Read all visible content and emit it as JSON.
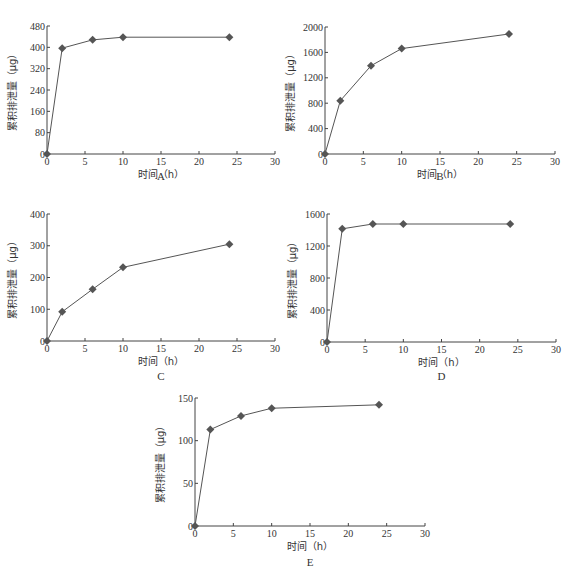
{
  "chart_data": [
    {
      "id": "A",
      "type": "line",
      "panel_label": "A",
      "xlabel": "时间（h）",
      "ylabel": "累积排泄量（μg）",
      "x": [
        0,
        2,
        6,
        10,
        24
      ],
      "values": [
        0,
        397,
        428,
        438,
        438
      ],
      "xlim": [
        0,
        30
      ],
      "ylim": [
        0,
        480
      ],
      "xticks": [
        0,
        5,
        10,
        15,
        20,
        25,
        30
      ],
      "yticks": [
        0,
        80,
        160,
        240,
        320,
        400,
        480
      ],
      "grid": false,
      "marker": "diamond",
      "layout": {
        "x0": 47,
        "x1": 275,
        "yTop": 26,
        "yBottom": 154,
        "labelY": 180
      }
    },
    {
      "id": "B",
      "type": "line",
      "panel_label": "B",
      "xlabel": "时间（h）",
      "ylabel": "累积排泄量（μg）",
      "x": [
        0,
        2,
        6,
        10,
        24
      ],
      "values": [
        0,
        840,
        1390,
        1660,
        1890
      ],
      "xlim": [
        0,
        30
      ],
      "ylim": [
        0,
        2000
      ],
      "xticks": [
        0,
        5,
        10,
        15,
        20,
        25,
        30
      ],
      "yticks": [
        0,
        400,
        800,
        1200,
        1600,
        2000
      ],
      "grid": false,
      "marker": "diamond",
      "layout": {
        "x0": 325,
        "x1": 555,
        "yTop": 27,
        "yBottom": 154,
        "labelY": 180
      }
    },
    {
      "id": "C",
      "type": "line",
      "panel_label": "C",
      "xlabel": "时间（h）",
      "ylabel": "累积排泄量（μg）",
      "x": [
        0,
        2,
        6,
        10,
        24
      ],
      "values": [
        0,
        92,
        163,
        232,
        305
      ],
      "xlim": [
        0,
        30
      ],
      "ylim": [
        0,
        400
      ],
      "xticks": [
        0,
        5,
        10,
        15,
        20,
        25,
        30
      ],
      "yticks": [
        0,
        100,
        200,
        300,
        400
      ],
      "grid": false,
      "marker": "diamond",
      "layout": {
        "x0": 47,
        "x1": 275,
        "yTop": 214,
        "yBottom": 341,
        "labelY": 380
      }
    },
    {
      "id": "D",
      "type": "line",
      "panel_label": "D",
      "xlabel": "时间（h）",
      "ylabel": "累积排泄量（μg）",
      "x": [
        0,
        2,
        6,
        10,
        24
      ],
      "values": [
        0,
        1415,
        1475,
        1475,
        1475
      ],
      "xlim": [
        0,
        30
      ],
      "ylim": [
        0,
        1600
      ],
      "xticks": [
        0,
        5,
        10,
        15,
        20,
        25,
        30
      ],
      "yticks": [
        0,
        400,
        800,
        1200,
        1600
      ],
      "grid": false,
      "marker": "diamond",
      "layout": {
        "x0": 327,
        "x1": 556,
        "yTop": 214,
        "yBottom": 342,
        "labelY": 380
      }
    },
    {
      "id": "E",
      "type": "line",
      "panel_label": "E",
      "xlabel": "时间（h）",
      "ylabel": "累积排泄量（μg）",
      "x": [
        0,
        2,
        6,
        10,
        24
      ],
      "values": [
        0,
        113,
        129,
        138,
        142
      ],
      "xlim": [
        0,
        30
      ],
      "ylim": [
        0,
        150
      ],
      "xticks": [
        0,
        5,
        10,
        15,
        20,
        25,
        30
      ],
      "yticks": [
        0,
        50,
        100,
        150
      ],
      "grid": false,
      "marker": "diamond",
      "layout": {
        "x0": 195,
        "x1": 425,
        "yTop": 398,
        "yBottom": 526,
        "labelY": 566
      }
    }
  ],
  "colors": {
    "axis": "#444444",
    "series": "#555555",
    "marker": "#555555",
    "text": "#333333"
  }
}
